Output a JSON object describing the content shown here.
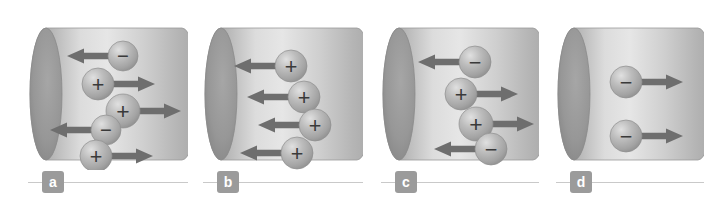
{
  "figure": {
    "background_color": "#ffffff",
    "cylinder_body_color": "#b9b9b9",
    "cylinder_highlight_color": "#e4e4e4",
    "cylinder_cap_color": "#8f8f8f",
    "arrow_color": "#6e6e6e",
    "sphere_color": "#b0b0b0",
    "label_badge_color": "#9b9b9b",
    "label_text_color": "#ffffff",
    "rule_color": "#c9c9c9"
  },
  "panels": [
    {
      "id": "a",
      "label": "a",
      "left": 28,
      "width": 160,
      "charges": [
        {
          "sign": "-",
          "symbol": "−",
          "direction": "left",
          "cx": 95,
          "cy": 38,
          "r": 15
        },
        {
          "sign": "+",
          "symbol": "+",
          "direction": "right",
          "cx": 70,
          "cy": 66,
          "r": 16
        },
        {
          "sign": "+",
          "symbol": "+",
          "direction": "right",
          "cx": 95,
          "cy": 93,
          "r": 17
        },
        {
          "sign": "-",
          "symbol": "−",
          "direction": "left",
          "cx": 78,
          "cy": 112,
          "r": 15
        },
        {
          "sign": "+",
          "symbol": "+",
          "direction": "right",
          "cx": 68,
          "cy": 138,
          "r": 16
        }
      ]
    },
    {
      "id": "b",
      "label": "b",
      "left": 203,
      "width": 160,
      "charges": [
        {
          "sign": "+",
          "symbol": "+",
          "direction": "left",
          "cx": 88,
          "cy": 48,
          "r": 16
        },
        {
          "sign": "+",
          "symbol": "+",
          "direction": "left",
          "cx": 101,
          "cy": 79,
          "r": 16
        },
        {
          "sign": "+",
          "symbol": "+",
          "direction": "left",
          "cx": 112,
          "cy": 107,
          "r": 16
        },
        {
          "sign": "+",
          "symbol": "+",
          "direction": "left",
          "cx": 94,
          "cy": 135,
          "r": 16
        }
      ]
    },
    {
      "id": "c",
      "label": "c",
      "left": 381,
      "width": 158,
      "charges": [
        {
          "sign": "-",
          "symbol": "−",
          "direction": "left",
          "cx": 94,
          "cy": 44,
          "r": 16
        },
        {
          "sign": "+",
          "symbol": "+",
          "direction": "right",
          "cx": 80,
          "cy": 76,
          "r": 16
        },
        {
          "sign": "+",
          "symbol": "+",
          "direction": "right",
          "cx": 95,
          "cy": 106,
          "r": 17
        },
        {
          "sign": "-",
          "symbol": "−",
          "direction": "left",
          "cx": 110,
          "cy": 131,
          "r": 16
        }
      ]
    },
    {
      "id": "d",
      "label": "d",
      "left": 556,
      "width": 148,
      "charges": [
        {
          "sign": "-",
          "symbol": "−",
          "direction": "right",
          "cx": 70,
          "cy": 64,
          "r": 16
        },
        {
          "sign": "-",
          "symbol": "−",
          "direction": "right",
          "cx": 70,
          "cy": 118,
          "r": 16
        }
      ]
    }
  ]
}
